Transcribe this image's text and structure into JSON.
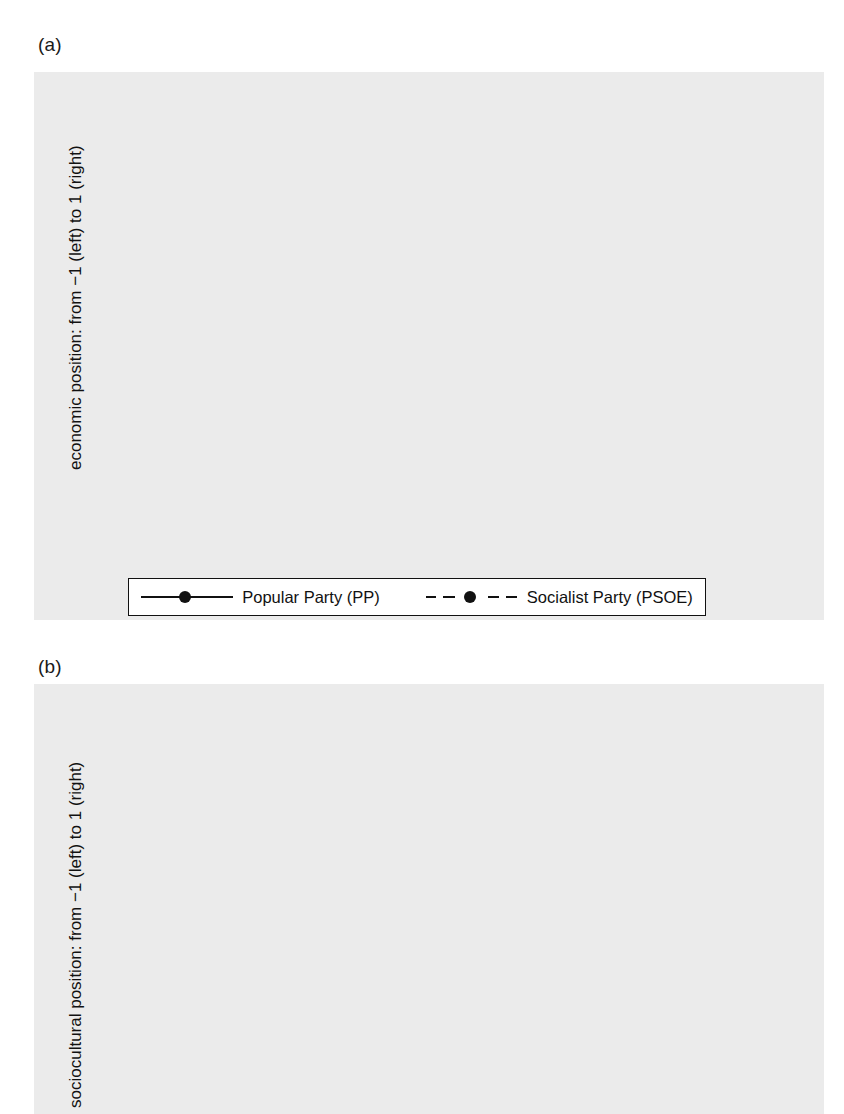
{
  "figure": {
    "panels": [
      {
        "id": "a",
        "label": "(a)",
        "ylabel": "economic position: from −1 (left) to 1 (right)",
        "xlabel": "year"
      },
      {
        "id": "b",
        "label": "(b)",
        "ylabel": "sociocultural position: from −1 (left) to 1 (right)",
        "xlabel": ""
      }
    ]
  },
  "legend": {
    "entries": [
      {
        "label": "Popular Party (PP)",
        "style": "solid",
        "marker": "filled-circle",
        "color": "#111111"
      },
      {
        "label": "Socialist Party (PSOE)",
        "style": "dashed",
        "marker": "filled-circle",
        "color": "#111111"
      }
    ]
  },
  "periods": [
    {
      "label": "PSOE",
      "start": 1982,
      "end": 1996
    },
    {
      "label": "PP",
      "start": 1996,
      "end": 2004
    },
    {
      "label": "PSOE",
      "start": 2004,
      "end": 2011
    },
    {
      "label": "PP",
      "start": 2011,
      "end": 2016
    }
  ],
  "period_dividers": [
    1982,
    1996,
    2004,
    2011
  ],
  "chart_data": [
    {
      "type": "line",
      "panel": "a",
      "title": "(a)",
      "xlabel": "year",
      "ylabel": "economic position: from −1 (left) to 1 (right)",
      "x": [
        1979,
        1982,
        1986,
        1989,
        1993,
        1996,
        2000,
        2004,
        2008,
        2011,
        2015,
        2016
      ],
      "xticklabels": [
        "1979",
        "1982",
        "1986",
        "1989",
        "1993",
        "1996",
        "2000",
        "2004",
        "2008",
        "2011",
        "2015",
        "2016"
      ],
      "yticks": [
        -1,
        -0.75,
        -0.5,
        -0.25,
        0,
        0.25,
        0.5,
        0.75,
        1
      ],
      "yticklabels": [
        "-1",
        "-.75",
        "-.5",
        "-.25",
        "0",
        ".25",
        ".5",
        ".75",
        "1"
      ],
      "ylim": [
        -1,
        1
      ],
      "grid": true,
      "legend_position": "below",
      "zero_line": 0,
      "series": [
        {
          "name": "Popular Party (PP)",
          "style": "solid",
          "values": [
            -0.01,
            0.15,
            0.19,
            -0.42,
            -0.25,
            0.13,
            0.02,
            -0.31,
            -0.4,
            -0.11,
            -0.6,
            -0.6
          ]
        },
        {
          "name": "Socialist Party (PSOE)",
          "style": "dashed",
          "values": [
            -0.79,
            -0.77,
            -0.68,
            -0.67,
            -0.86,
            -0.76,
            -0.28,
            -0.71,
            -0.82,
            -0.78,
            -0.75,
            -0.81,
            -0.81
          ]
        }
      ]
    },
    {
      "type": "line",
      "panel": "b",
      "title": "(b)",
      "xlabel": "",
      "ylabel": "sociocultural position: from −1 (left) to 1 (right)",
      "x": [
        1979,
        1982,
        1986,
        1989,
        1993,
        1996,
        2000,
        2004,
        2008,
        2011,
        2015,
        2016
      ],
      "xticklabels": [
        "1979",
        "1982",
        "1986",
        "1989",
        "1993",
        "1996",
        "2000",
        "2004",
        "2008",
        "2011",
        "2015",
        "2016"
      ],
      "yticks": [
        -1,
        -0.75,
        -0.5,
        -0.25,
        0,
        0.25,
        0.5,
        0.75,
        1
      ],
      "yticklabels": [
        "-1",
        "-.75",
        "-.5",
        "-.25",
        "0",
        ".25",
        ".5",
        ".75",
        "1"
      ],
      "ylim": [
        -1,
        1
      ],
      "grid": true,
      "legend_position": "none",
      "zero_line": 0,
      "series": [
        {
          "name": "Popular Party (PP)",
          "style": "solid",
          "values": [
            0.71,
            0.71,
            0.24,
            0.18,
            0.05,
            0.01,
            0.11,
            -0.15,
            0.03,
            -0.19,
            -0.11,
            0.05,
            0.05
          ]
        },
        {
          "name": "Socialist Party (PSOE)",
          "style": "dashed",
          "values": [
            0.07,
            0.21,
            0.04,
            -0.13,
            -0.25,
            -0.34,
            -0.31,
            -0.24,
            -0.34,
            -0.46,
            -0.43,
            -0.18,
            -0.18
          ]
        }
      ]
    }
  ]
}
